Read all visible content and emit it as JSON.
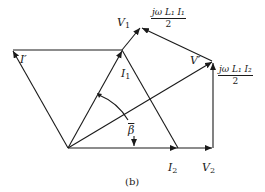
{
  "figure": {
    "caption": "(b)",
    "labels": {
      "I_prime": "I′",
      "V1": "V",
      "V1_sub": "1",
      "I1": "I",
      "I1_sub": "1",
      "V_prime": "V′",
      "I2": "I",
      "I2_sub": "2",
      "V2": "V",
      "V2_sub": "2",
      "beta": "β",
      "drop1_num": "jω L₁ I₁",
      "drop1_den": "2",
      "drop2_num": "jω L₁ I₂",
      "drop2_den": "2"
    },
    "colors": {
      "stroke": "#1a1a1a",
      "background": "#ffffff"
    }
  }
}
